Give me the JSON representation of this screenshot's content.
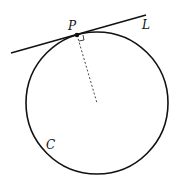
{
  "diagram": {
    "labels": {
      "point": "P",
      "line": "L",
      "circle": "C"
    },
    "colors": {
      "stroke": "#111111",
      "background": "#ffffff"
    },
    "geometry": {
      "circle_center": [
        97,
        103
      ],
      "circle_radius": 71,
      "tangent_point": [
        76,
        35
      ],
      "line_start": [
        11,
        53
      ],
      "line_end": [
        146,
        15
      ]
    }
  }
}
